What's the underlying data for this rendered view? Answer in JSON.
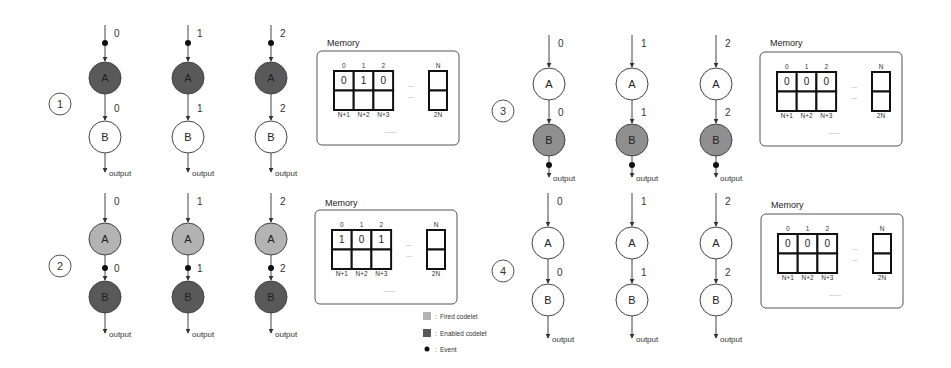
{
  "colors": {
    "fired": "#b3b3b3",
    "enabled": "#595959",
    "enabled_alt": "#8f8f8f",
    "idle": "#ffffff",
    "event": "#111111",
    "stroke": "#444444"
  },
  "legend": {
    "fired": "Fired codelet",
    "enabled": "Enabled codelet",
    "event": "Event",
    "separator": ":"
  },
  "panels": [
    {
      "step": "1",
      "memory": {
        "title": "Memory",
        "col_labels": [
          "0",
          "1",
          "2"
        ],
        "values": [
          "0",
          "1",
          "0"
        ],
        "bottom_labels": [
          "N+1",
          "N+2",
          "N+3"
        ],
        "right_top": "N",
        "right_bottom": "2N",
        "ellipsis_h": "...",
        "ellipsis_bottom": "......"
      },
      "columns": [
        {
          "input": "0",
          "mid": "0",
          "output": "output",
          "a_state": "enabled",
          "b_state": "idle",
          "event_at": "input"
        },
        {
          "input": "1",
          "mid": "1",
          "output": "output",
          "a_state": "enabled",
          "b_state": "idle",
          "event_at": "input"
        },
        {
          "input": "2",
          "mid": "2",
          "output": "output",
          "a_state": "enabled",
          "b_state": "idle",
          "event_at": "input"
        }
      ]
    },
    {
      "step": "2",
      "memory": {
        "title": "Memory",
        "col_labels": [
          "0",
          "1",
          "2"
        ],
        "values": [
          "1",
          "0",
          "1"
        ],
        "bottom_labels": [
          "N+1",
          "N+2",
          "N+3"
        ],
        "right_top": "N",
        "right_bottom": "2N",
        "ellipsis_h": "...",
        "ellipsis_bottom": "......"
      },
      "columns": [
        {
          "input": "0",
          "mid": "0",
          "output": "output",
          "a_state": "fired",
          "b_state": "enabled",
          "event_at": "mid"
        },
        {
          "input": "1",
          "mid": "1",
          "output": "output",
          "a_state": "fired",
          "b_state": "enabled",
          "event_at": "mid"
        },
        {
          "input": "2",
          "mid": "2",
          "output": "output",
          "a_state": "fired",
          "b_state": "enabled",
          "event_at": "mid"
        }
      ]
    },
    {
      "step": "3",
      "memory": {
        "title": "Memory",
        "col_labels": [
          "0",
          "1",
          "2"
        ],
        "values": [
          "0",
          "0",
          "0"
        ],
        "bottom_labels": [
          "N+1",
          "N+2",
          "N+3"
        ],
        "right_top": "N",
        "right_bottom": "2N",
        "ellipsis_h": "...",
        "ellipsis_bottom": "......"
      },
      "columns": [
        {
          "input": "0",
          "mid": "0",
          "output": "output",
          "a_state": "idle",
          "b_state": "enabled_alt",
          "event_at": "output"
        },
        {
          "input": "1",
          "mid": "1",
          "output": "output",
          "a_state": "idle",
          "b_state": "enabled_alt",
          "event_at": "output"
        },
        {
          "input": "2",
          "mid": "2",
          "output": "output",
          "a_state": "idle",
          "b_state": "enabled_alt",
          "event_at": "output"
        }
      ]
    },
    {
      "step": "4",
      "memory": {
        "title": "Memory",
        "col_labels": [
          "0",
          "1",
          "2"
        ],
        "values": [
          "0",
          "0",
          "0"
        ],
        "bottom_labels": [
          "N+1",
          "N+2",
          "N+3"
        ],
        "right_top": "N",
        "right_bottom": "2N",
        "ellipsis_h": "...",
        "ellipsis_bottom": "......"
      },
      "columns": [
        {
          "input": "0",
          "mid": "0",
          "output": "output",
          "a_state": "idle",
          "b_state": "idle",
          "event_at": "none"
        },
        {
          "input": "1",
          "mid": "1",
          "output": "output",
          "a_state": "idle",
          "b_state": "idle",
          "event_at": "none"
        },
        {
          "input": "2",
          "mid": "2",
          "output": "output",
          "a_state": "idle",
          "b_state": "idle",
          "event_at": "none"
        }
      ]
    }
  ],
  "node_labels": {
    "a": "A",
    "b": "B"
  }
}
